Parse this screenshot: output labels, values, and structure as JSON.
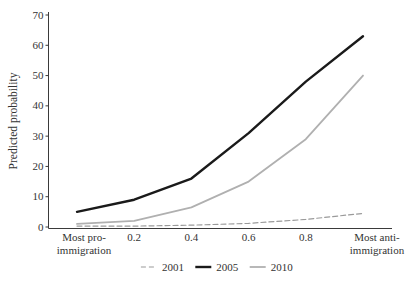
{
  "figure": {
    "background": "#ffffff",
    "text_color": "#333333",
    "axis_color": "#3a3a3a"
  },
  "chart_data": {
    "type": "line",
    "title": "",
    "xlabel": "",
    "ylabel": "Predicted probability",
    "x": [
      0,
      0.2,
      0.4,
      0.6,
      0.8,
      1.0
    ],
    "x_numeric_tick_labels": [
      "0.2",
      "0.4",
      "0.6",
      "0.8"
    ],
    "x_numeric_tick_values": [
      0.2,
      0.4,
      0.6,
      0.8
    ],
    "x_end_labels": {
      "left_line1": "Most pro-",
      "left_line2": "immigration",
      "right_line1": "Most anti-",
      "right_line2": "immigration"
    },
    "ylim": [
      0,
      70
    ],
    "y_ticks": [
      0,
      10,
      20,
      30,
      40,
      50,
      60,
      70
    ],
    "grid": false,
    "legend_position": "bottom-center",
    "series": [
      {
        "name": "2001",
        "color": "#9a9a9a",
        "dash": "5 3",
        "width": 1.2,
        "values": [
          0.3,
          0.3,
          0.6,
          1.2,
          2.5,
          4.5
        ]
      },
      {
        "name": "2005",
        "color": "#1a1a1a",
        "dash": null,
        "width": 2.4,
        "values": [
          5,
          9,
          16,
          31,
          48,
          63
        ]
      },
      {
        "name": "2010",
        "color": "#b0b0b0",
        "dash": null,
        "width": 1.8,
        "values": [
          1,
          2,
          6.5,
          15,
          29,
          50
        ]
      }
    ]
  }
}
